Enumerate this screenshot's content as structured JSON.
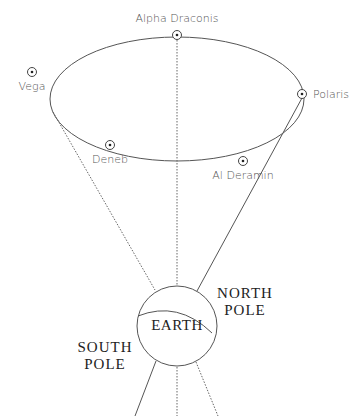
{
  "diagram": {
    "colors": {
      "line": "#555555",
      "text_light": "#555555",
      "text_dark": "#222222",
      "background": "#ffffff"
    },
    "stars": [
      {
        "id": "alpha-draconis",
        "label": "Alpha Draconis",
        "marker": [
          177,
          35
        ],
        "label_pos": [
          177,
          22
        ],
        "anchor": "middle"
      },
      {
        "id": "vega",
        "label": "Vega",
        "marker": [
          32,
          72
        ],
        "label_pos": [
          32,
          92
        ],
        "anchor": "middle"
      },
      {
        "id": "polaris",
        "label": "Polaris",
        "marker": [
          302,
          94
        ],
        "label_pos": [
          312,
          98
        ],
        "anchor": "start"
      },
      {
        "id": "deneb",
        "label": "Deneb",
        "marker": [
          110,
          145
        ],
        "label_pos": [
          110,
          165
        ],
        "anchor": "middle"
      },
      {
        "id": "al-deramin",
        "label": "Al Deramin",
        "marker": [
          243,
          161
        ],
        "label_pos": [
          243,
          180
        ],
        "anchor": "middle"
      }
    ],
    "precession_circle": {
      "cx": 177,
      "cy": 99,
      "rx": 127,
      "ry": 62
    },
    "earth": {
      "label": "EARTH",
      "cx": 177,
      "cy": 326,
      "r": 40
    },
    "north_pole": {
      "line1": "NORTH",
      "line2": "POLE"
    },
    "south_pole": {
      "line1": "SOUTH",
      "line2": "POLE"
    }
  }
}
